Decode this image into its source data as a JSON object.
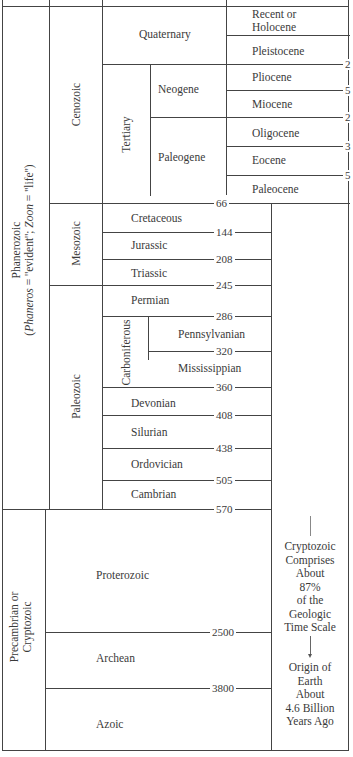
{
  "eons": [
    {
      "name": "Phanerozoic",
      "note_prefix": "(",
      "note_phaneros": "Phaneros",
      "note_mid": " = ''evident''; ",
      "note_zoon": "Zoon",
      "note_suffix": " = ''life'')"
    },
    {
      "name": "Precambrian or",
      "name2": "Cryptozoic"
    }
  ],
  "eras": {
    "cenozoic": "Cenozoic",
    "mesozoic": "Mesozoic",
    "paleozoic": "Paleozoic",
    "proterozoic": "Proterozoic",
    "archean": "Archean",
    "azoic": "Azoic"
  },
  "periods": {
    "quaternary": "Quaternary",
    "tertiary": "Tertiary",
    "neogene": "Neogene",
    "paleogene": "Paleogene",
    "cretaceous": "Cretaceous",
    "jurassic": "Jurassic",
    "triassic": "Triassic",
    "permian": "Permian",
    "carboniferous": "Carboniferous",
    "pennsylvanian": "Pennsylvanian",
    "mississippian": "Mississippian",
    "devonian": "Devonian",
    "silurian": "Silurian",
    "ordovician": "Ordovician",
    "cambrian": "Cambrian"
  },
  "epochs": {
    "recent1": "Recent or",
    "recent2": "Holocene",
    "pleistocene": "Pleistocene",
    "pliocene": "Pliocene",
    "miocene": "Miocene",
    "oligocene": "Oligocene",
    "eocene": "Eocene",
    "paleocene": "Paleocene"
  },
  "boundaries": {
    "b66": "66",
    "b144": "144",
    "b208": "208",
    "b245": "245",
    "b286": "286",
    "b320": "320",
    "b360": "360",
    "b408": "408",
    "b438": "438",
    "b505": "505",
    "b570": "570",
    "b2500": "2500",
    "b3800": "3800",
    "clip1": "2",
    "clip2": "5",
    "clip3": "2",
    "clip4": "3",
    "clip5": "5"
  },
  "note": {
    "l1": "Cryptozoic",
    "l2": "Comprises",
    "l3": "About",
    "l4": "87%",
    "l5": "of the",
    "l6": "Geologic",
    "l7": "Time Scale",
    "l8": "Origin of",
    "l9": "Earth",
    "l10": "About",
    "l11": "4.6 Billion",
    "l12": "Years Ago"
  }
}
